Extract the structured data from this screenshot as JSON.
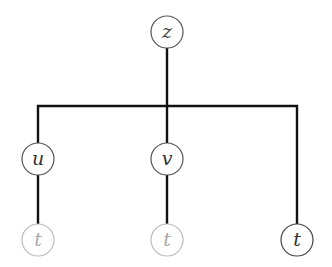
{
  "diagram": {
    "type": "tree",
    "colors": {
      "edge": "#111111",
      "node_dark": "#444444",
      "node_faded": "#bbbbbb",
      "label_dark": "#333333",
      "label_faded": "#aaaaaa"
    },
    "root": {
      "id": "z",
      "label": "z",
      "style": "dark"
    },
    "children": [
      {
        "id": "u",
        "label": "u",
        "style": "dark",
        "children": [
          {
            "id": "t1",
            "label": "t",
            "style": "faded"
          }
        ]
      },
      {
        "id": "v",
        "label": "v",
        "style": "dark",
        "children": [
          {
            "id": "t2",
            "label": "t",
            "style": "faded"
          }
        ]
      },
      {
        "id": "t3",
        "label": "t",
        "style": "dark"
      }
    ]
  }
}
